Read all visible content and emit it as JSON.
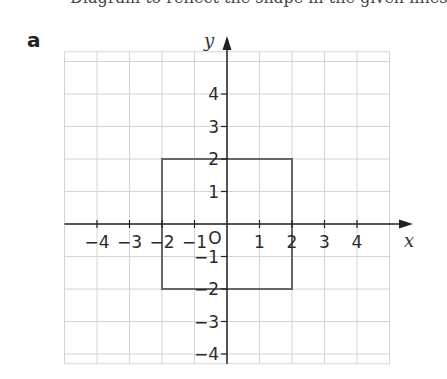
{
  "header": {
    "cut_text": "Diagram to reflect the shape in the given lines",
    "part_label": "a"
  },
  "colors": {
    "grid": "#d4d4d4",
    "axis": "#222222",
    "shape": "#666666",
    "text": "#2a2a2a"
  },
  "diagram": {
    "type": "coordinate-grid",
    "origin_px": [
      227,
      224
    ],
    "unit_px": 32.5,
    "x_range": [
      -5,
      5
    ],
    "y_range": [
      -4.3,
      5.3
    ],
    "axis_labels": {
      "x": "x",
      "y": "y"
    },
    "x_ticks": [
      {
        "value": -4,
        "label": "−4"
      },
      {
        "value": -3,
        "label": "−3"
      },
      {
        "value": -2,
        "label": "−2"
      },
      {
        "value": -1,
        "label": "−1"
      },
      {
        "value": 1,
        "label": "1"
      },
      {
        "value": 2,
        "label": "2"
      },
      {
        "value": 3,
        "label": "3"
      },
      {
        "value": 4,
        "label": "4"
      }
    ],
    "y_ticks": [
      {
        "value": 4,
        "label": "4"
      },
      {
        "value": 3,
        "label": "3"
      },
      {
        "value": 2,
        "label": "2"
      },
      {
        "value": 1,
        "label": "1"
      },
      {
        "value": -1,
        "label": "−1"
      },
      {
        "value": -2,
        "label": "−2"
      },
      {
        "value": -3,
        "label": "−3"
      },
      {
        "value": -4,
        "label": "−4"
      }
    ],
    "origin_label": "O",
    "shape": {
      "name": "square",
      "vertices": [
        [
          -2,
          2
        ],
        [
          2,
          2
        ],
        [
          2,
          -2
        ],
        [
          -2,
          -2
        ]
      ]
    }
  }
}
